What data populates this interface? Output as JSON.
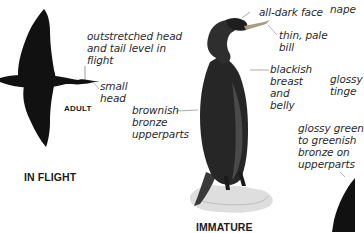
{
  "page": {
    "colors": {
      "silhouette": "#111111",
      "text": "#2a2a2a",
      "background": "#ffffff",
      "rock": "#dcdcdc"
    }
  },
  "flight_panel": {
    "caption": "IN FLIGHT",
    "age_label": "ADULT",
    "annotations": [
      {
        "id": "outstretched",
        "text": "outstretched head\nand tail level in\nflight"
      },
      {
        "id": "small-head",
        "text": "small\nhead"
      }
    ]
  },
  "immature_panel": {
    "caption": "IMMATURE",
    "annotations": [
      {
        "id": "all-dark-face",
        "text": "all-dark face"
      },
      {
        "id": "thin-pale-bill",
        "text": "thin, pale\nbill"
      },
      {
        "id": "blackish-breast",
        "text": "blackish\nbreast\nand\nbelly"
      },
      {
        "id": "brownish-bronze",
        "text": "brownish\nbronze\nupperparts"
      }
    ]
  },
  "adult_panel_partial": {
    "annotations": [
      {
        "id": "nape",
        "text": "nape"
      },
      {
        "id": "glossy-tinge",
        "text": "glossy\ntinge"
      },
      {
        "id": "glossy-green",
        "text": "glossy green\nto greenish\nbronze on\nupperparts"
      }
    ]
  }
}
